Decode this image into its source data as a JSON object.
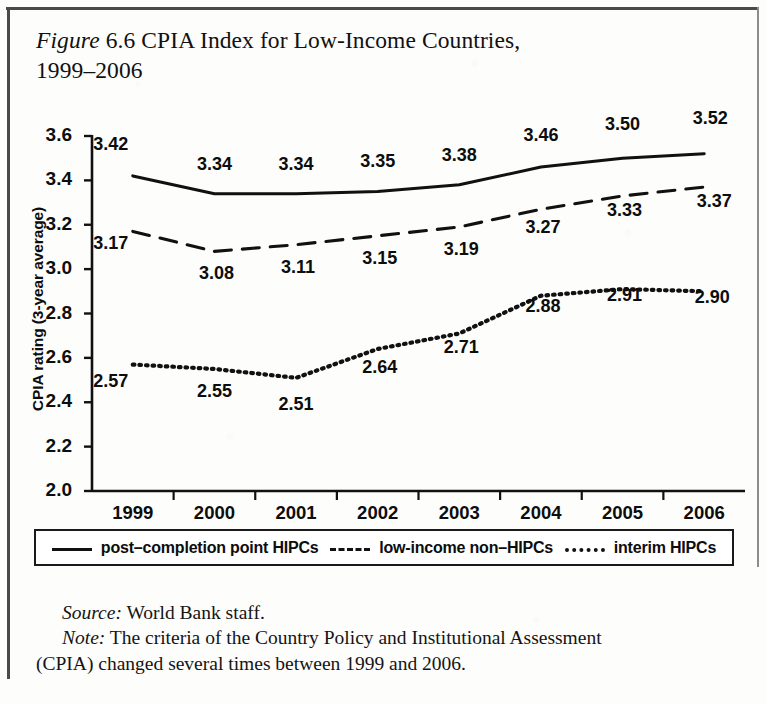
{
  "figure": {
    "label_italic": "Figure",
    "number": "6.6",
    "title_rest": "CPIA Index for Low-Income Countries,",
    "title_line2": "1999–2006"
  },
  "chart_data": {
    "type": "line",
    "title": "Figure 6.6 CPIA Index for Low-Income Countries, 1999–2006",
    "xlabel": "",
    "ylabel": "CPIA rating (3-year average)",
    "categories": [
      "1999",
      "2000",
      "2001",
      "2002",
      "2003",
      "2004",
      "2005",
      "2006"
    ],
    "ylim": [
      2.0,
      3.6
    ],
    "ytick_labels": [
      "3.6",
      "3.4",
      "3.2",
      "3.0",
      "2.8",
      "2.6",
      "2.4",
      "2.2",
      "2.0"
    ],
    "ytick_values": [
      3.6,
      3.4,
      3.2,
      3.0,
      2.8,
      2.6,
      2.4,
      2.2,
      2.0
    ],
    "grid": false,
    "legend_position": "below-plot",
    "series": [
      {
        "name": "post–completion point HIPCs",
        "style": "solid",
        "color": "#111111",
        "values": [
          3.42,
          3.34,
          3.34,
          3.35,
          3.38,
          3.46,
          3.5,
          3.52
        ],
        "labels": [
          "3.42",
          "3.34",
          "3.34",
          "3.35",
          "3.38",
          "3.46",
          "3.50",
          "3.52"
        ]
      },
      {
        "name": "low-income non–HIPCs",
        "style": "dashed",
        "color": "#111111",
        "values": [
          3.17,
          3.08,
          3.11,
          3.15,
          3.19,
          3.27,
          3.33,
          3.37
        ],
        "labels": [
          "3.17",
          "3.08",
          "3.11",
          "3.15",
          "3.19",
          "3.27",
          "3.33",
          "3.37"
        ]
      },
      {
        "name": "interim HIPCs",
        "style": "dotted",
        "color": "#111111",
        "values": [
          2.57,
          2.55,
          2.51,
          2.64,
          2.71,
          2.88,
          2.91,
          2.9
        ],
        "labels": [
          "2.57",
          "2.55",
          "2.51",
          "2.64",
          "2.71",
          "2.88",
          "2.91",
          "2.90"
        ]
      }
    ]
  },
  "legend": {
    "items": [
      {
        "label": "post–completion point HIPCs",
        "style": "solid"
      },
      {
        "label": "low-income non–HIPCs",
        "style": "dashed"
      },
      {
        "label": "interim HIPCs",
        "style": "dotted"
      }
    ]
  },
  "notes": {
    "source_lead": "Source:",
    "source_text": "World Bank staff.",
    "note_lead": "Note:",
    "note_text": "The criteria of the Country Policy and Institutional Assessment",
    "note_text_cont": "(CPIA) changed several times between 1999 and 2006."
  }
}
